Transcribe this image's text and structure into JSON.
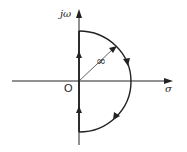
{
  "diagram": {
    "axes": {
      "vertical_label": "jω",
      "horizontal_label": "σ",
      "origin_label": "O"
    },
    "radius_label": "∞",
    "colors": {
      "stroke": "#222222",
      "background": "#ffffff"
    },
    "contour": {
      "shape": "right-half semicircle",
      "direction": "clockwise",
      "segments": [
        {
          "name": "imaginary-axis-lower",
          "direction": "up"
        },
        {
          "name": "imaginary-axis-upper",
          "direction": "up"
        },
        {
          "name": "arc-upper",
          "direction": "clockwise"
        },
        {
          "name": "arc-lower",
          "direction": "clockwise"
        }
      ]
    }
  }
}
